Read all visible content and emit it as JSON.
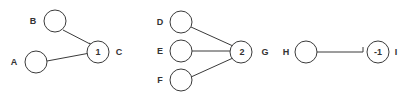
{
  "diagrams": [
    {
      "id": "panel-1",
      "nodes": [
        {
          "name": "B",
          "label": "B",
          "value": ""
        },
        {
          "name": "A",
          "label": "A",
          "value": ""
        },
        {
          "name": "C",
          "label": "C",
          "value": "1"
        }
      ],
      "edges": [
        {
          "from": "B",
          "to": "C",
          "type": "excitatory"
        },
        {
          "from": "A",
          "to": "C",
          "type": "excitatory"
        }
      ]
    },
    {
      "id": "panel-2",
      "nodes": [
        {
          "name": "D",
          "label": "D",
          "value": ""
        },
        {
          "name": "E",
          "label": "E",
          "value": ""
        },
        {
          "name": "F",
          "label": "F",
          "value": ""
        },
        {
          "name": "G",
          "label": "G",
          "value": "2"
        }
      ],
      "edges": [
        {
          "from": "D",
          "to": "G",
          "type": "excitatory"
        },
        {
          "from": "E",
          "to": "G",
          "type": "excitatory"
        },
        {
          "from": "F",
          "to": "G",
          "type": "excitatory"
        }
      ]
    },
    {
      "id": "panel-3",
      "nodes": [
        {
          "name": "H",
          "label": "H",
          "value": ""
        },
        {
          "name": "I",
          "label": "I",
          "value": "-1"
        }
      ],
      "edges": [
        {
          "from": "H",
          "to": "I",
          "type": "inhibitory"
        }
      ]
    }
  ],
  "colors": {
    "stroke": "#3a3a3a",
    "text": "#333333",
    "background": "#ffffff"
  }
}
